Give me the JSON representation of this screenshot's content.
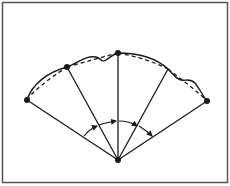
{
  "figure": {
    "colors": {
      "stroke": "#1a1a1a",
      "frame": "#555555",
      "background": "#ffffff"
    },
    "apex": {
      "x": 118,
      "y": 160
    },
    "points": [
      {
        "id": "p1",
        "x": 27,
        "y": 100,
        "dot": true
      },
      {
        "id": "p2",
        "x": 67,
        "y": 67,
        "dot": true
      },
      {
        "id": "p3",
        "x": 118,
        "y": 53,
        "dot": true
      },
      {
        "id": "p4",
        "x": 168,
        "y": 69,
        "dot": false
      },
      {
        "id": "p5",
        "x": 207,
        "y": 101,
        "dot": true
      }
    ],
    "angle_arrows": 4
  }
}
